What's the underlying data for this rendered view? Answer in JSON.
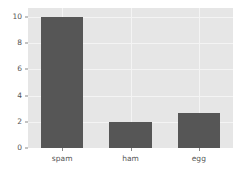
{
  "chart_data": {
    "type": "bar",
    "title": "",
    "subtitle": "",
    "xlabel": "",
    "ylabel": "",
    "categories": [
      "spam",
      "ham",
      "egg"
    ],
    "values": [
      10,
      2,
      2.7
    ],
    "series": [
      {
        "name": "counts",
        "values": [
          10,
          2,
          2.7
        ]
      }
    ],
    "ylim": [
      0,
      10.7
    ],
    "yticks": [
      0,
      2,
      4,
      6,
      8,
      10
    ],
    "ytick_labels": [
      "0",
      "2",
      "4",
      "6",
      "8",
      "10"
    ],
    "xtick_labels": [
      "spam",
      "ham",
      "egg"
    ],
    "grid": true,
    "grid_axis": "both",
    "legend": false,
    "legend_position": "none",
    "bar_color": "#565656",
    "plot_background": "#e6e6e6",
    "gridline_color": "#f4f4f4",
    "figure_background": "#ffffff",
    "tick_label_color": "#555555",
    "annotations": []
  }
}
